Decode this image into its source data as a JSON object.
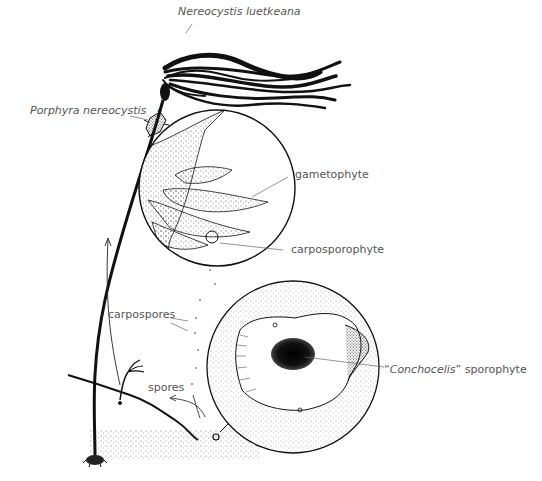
{
  "diagram": {
    "type": "life-cycle-illustration",
    "labels": {
      "kelp": "Nereocystis luetkeana",
      "porphyra": "Porphyra nereocystis",
      "gametophyte": "gametophyte",
      "carposporophyte": "carposporophyte",
      "carpospores": "carpospores",
      "spores": "spores",
      "conchocelis_quote_open": "“",
      "conchocelis_name": "Conchocelis",
      "conchocelis_quote_close": "”",
      "conchocelis_suffix": " sporophyte"
    },
    "colors": {
      "ink": "#111111",
      "label_text": "#555555",
      "leader_line": "#666666",
      "background": "#ffffff"
    }
  }
}
